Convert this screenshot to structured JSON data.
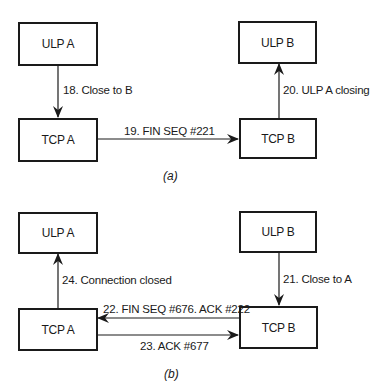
{
  "diagram": {
    "type": "tcp-connection-close-sequence",
    "colors": {
      "line": "#1a1a1a",
      "background": "#ffffff"
    },
    "part_a": {
      "caption": "(a)",
      "boxes": {
        "ulp_a": "ULP A",
        "tcp_a": "TCP A",
        "ulp_b": "ULP B",
        "tcp_b": "TCP B"
      },
      "arrows": [
        {
          "id": "18",
          "from": "ULP A",
          "to": "TCP A",
          "label": "18. Close to B"
        },
        {
          "id": "19",
          "from": "TCP A",
          "to": "TCP B",
          "label": "19. FIN SEQ #221"
        },
        {
          "id": "20",
          "from": "TCP B",
          "to": "ULP B",
          "label": "20. ULP A closing"
        }
      ]
    },
    "part_b": {
      "caption": "(b)",
      "boxes": {
        "ulp_a": "ULP A",
        "tcp_a": "TCP A",
        "ulp_b": "ULP B",
        "tcp_b": "TCP B"
      },
      "arrows": [
        {
          "id": "21",
          "from": "ULP B",
          "to": "TCP B",
          "label": "21. Close to A"
        },
        {
          "id": "22",
          "from": "TCP B",
          "to": "TCP A",
          "label": "22. FIN SEQ #676. ACK #222"
        },
        {
          "id": "23",
          "from": "TCP A",
          "to": "TCP B",
          "label": "23. ACK #677"
        },
        {
          "id": "24",
          "from": "TCP A",
          "to": "ULP A",
          "label": "24. Connection closed"
        }
      ]
    }
  }
}
